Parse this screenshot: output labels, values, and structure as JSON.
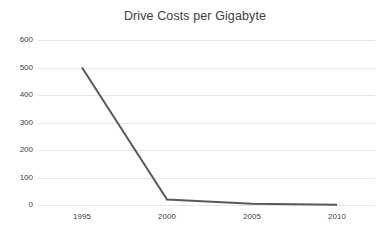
{
  "chart_data": {
    "type": "line",
    "title": "Drive Costs per Gigabyte",
    "xlabel": "",
    "ylabel": "",
    "x": [
      1995,
      2000,
      2005,
      2010
    ],
    "categories": [
      "1995",
      "2000",
      "2005",
      "2010"
    ],
    "series": [
      {
        "name": "Drive Costs per Gigabyte",
        "values": [
          500,
          20,
          5,
          1
        ],
        "color": "#595959",
        "line_width": 2
      }
    ],
    "xlim": [
      1995,
      2010
    ],
    "ylim": [
      0,
      600
    ],
    "ytick_labels": [
      "600",
      "500",
      "400",
      "300",
      "200",
      "100",
      "0"
    ],
    "ytick_values": [
      600,
      500,
      400,
      300,
      200,
      100,
      0
    ],
    "xtick_labels": [
      "1995",
      "2000",
      "2005",
      "2010"
    ],
    "xtick_values": [
      1995,
      2000,
      2005,
      2010
    ],
    "grid": {
      "horizontal": true,
      "vertical": false,
      "color": "#e6e6e6"
    },
    "legend": {
      "visible": false,
      "position": "none"
    },
    "background_color": "#ffffff",
    "title_color": "#404040",
    "tick_label_color": "#3f3f3f"
  }
}
